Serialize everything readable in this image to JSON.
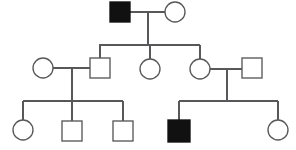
{
  "diagram": {
    "type": "pedigree",
    "generations": 3,
    "legend": {
      "affected_label": "Affected",
      "unaffected_label": "Unaffected",
      "male_label": "Male (square)",
      "female_label": "Female (circle)"
    },
    "colors": {
      "line": "#58585a",
      "affected_fill": "#111111",
      "unaffected_fill": "#ffffff",
      "background": "#ffffff"
    },
    "individuals": [
      {
        "id": "I-1",
        "generation": 1,
        "sex": "male",
        "affected": true,
        "shape": "square",
        "cx": 120,
        "cy": 12,
        "size": 20
      },
      {
        "id": "I-2",
        "generation": 1,
        "sex": "female",
        "affected": false,
        "shape": "circle",
        "cx": 175,
        "cy": 12,
        "size": 20
      },
      {
        "id": "II-1",
        "generation": 2,
        "sex": "female",
        "affected": false,
        "shape": "circle",
        "cx": 43,
        "cy": 68,
        "size": 20
      },
      {
        "id": "II-2",
        "generation": 2,
        "sex": "male",
        "affected": false,
        "shape": "square",
        "cx": 100,
        "cy": 68,
        "size": 20
      },
      {
        "id": "II-3",
        "generation": 2,
        "sex": "female",
        "affected": false,
        "shape": "circle",
        "cx": 150,
        "cy": 69,
        "size": 20
      },
      {
        "id": "II-4",
        "generation": 2,
        "sex": "female",
        "affected": false,
        "shape": "circle",
        "cx": 200,
        "cy": 69,
        "size": 20
      },
      {
        "id": "II-5",
        "generation": 2,
        "sex": "male",
        "affected": false,
        "shape": "square",
        "cx": 252,
        "cy": 68,
        "size": 20
      },
      {
        "id": "III-1",
        "generation": 3,
        "sex": "female",
        "affected": false,
        "shape": "circle",
        "cx": 23,
        "cy": 130,
        "size": 20
      },
      {
        "id": "III-2",
        "generation": 3,
        "sex": "male",
        "affected": false,
        "shape": "square",
        "cx": 72,
        "cy": 131,
        "size": 20
      },
      {
        "id": "III-3",
        "generation": 3,
        "sex": "male",
        "affected": false,
        "shape": "square",
        "cx": 123,
        "cy": 131,
        "size": 20
      },
      {
        "id": "III-4",
        "generation": 3,
        "sex": "male",
        "affected": true,
        "shape": "square",
        "cx": 179,
        "cy": 131,
        "size": 22
      },
      {
        "id": "III-5",
        "generation": 3,
        "sex": "female",
        "affected": false,
        "shape": "circle",
        "cx": 278,
        "cy": 130,
        "size": 20
      }
    ],
    "matings": [
      {
        "id": "M-1",
        "partners": [
          "I-1",
          "I-2"
        ],
        "line_y": 12,
        "x1": 130,
        "x2": 165,
        "children": [
          "II-2",
          "II-3",
          "II-4"
        ]
      },
      {
        "id": "M-2",
        "partners": [
          "II-1",
          "II-2"
        ],
        "line_y": 68,
        "x1": 53,
        "x2": 90,
        "children": [
          "III-1",
          "III-2",
          "III-3"
        ]
      },
      {
        "id": "M-3",
        "partners": [
          "II-4",
          "II-5"
        ],
        "line_y": 69,
        "x1": 210,
        "x2": 242,
        "children": [
          "III-4",
          "III-5"
        ]
      }
    ],
    "sibships": [
      {
        "id": "S-1",
        "parent_mating": "M-1",
        "bar_y": 45,
        "bar_x1": 99,
        "bar_x2": 200,
        "drop_x": 148,
        "drop_from_y": 22,
        "stubs": [
          99,
          148,
          200
        ]
      },
      {
        "id": "S-2",
        "parent_mating": "M-2",
        "bar_y": 101,
        "bar_x1": 23,
        "bar_x2": 123,
        "drop_x": 72,
        "drop_from_y": 78,
        "stubs": [
          23,
          72,
          123
        ]
      },
      {
        "id": "S-3",
        "parent_mating": "M-3",
        "bar_y": 101,
        "bar_x1": 179,
        "bar_x2": 278,
        "drop_x": 227,
        "drop_from_y": 79,
        "stubs": [
          179,
          227,
          278
        ]
      }
    ],
    "counts": {
      "total_individuals": 12,
      "affected_individuals": 2,
      "males": 6,
      "females": 6
    }
  }
}
